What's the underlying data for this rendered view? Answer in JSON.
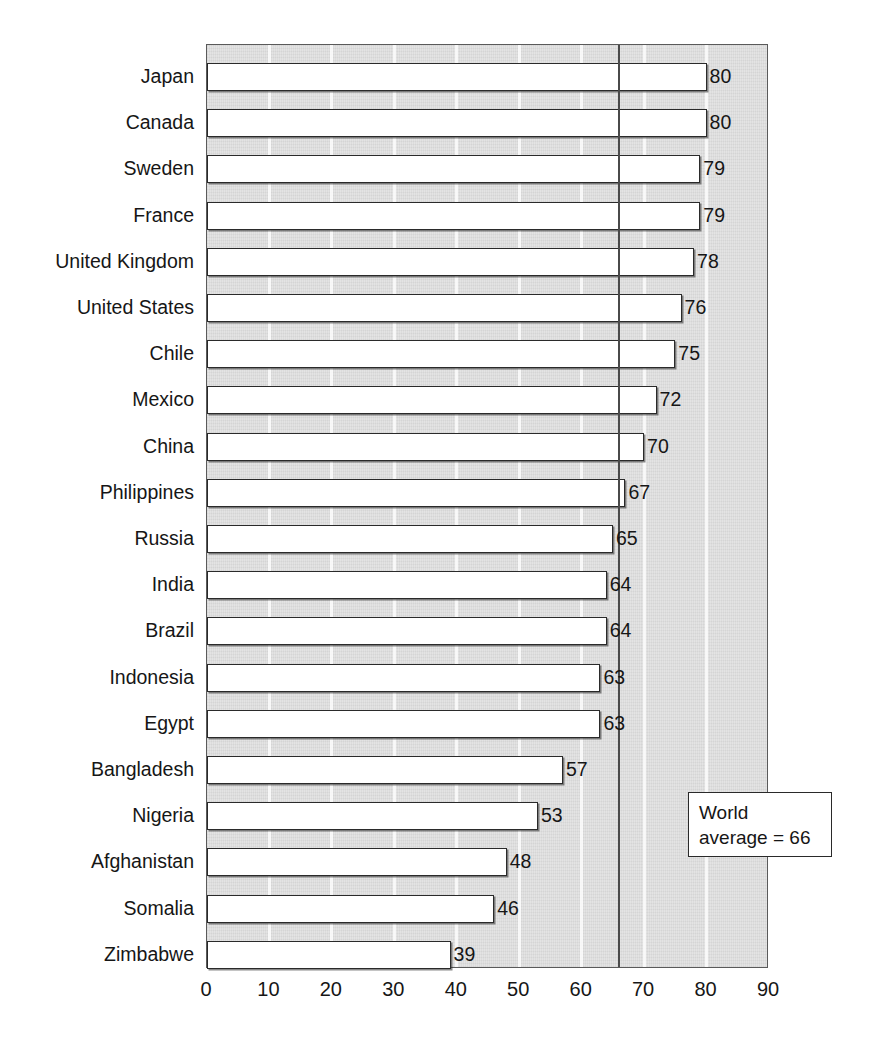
{
  "chart_data": {
    "type": "bar",
    "orientation": "horizontal",
    "title": "",
    "subtitle": "",
    "xlabel": "",
    "ylabel": "",
    "xlim": [
      0,
      90
    ],
    "xticks": [
      0,
      10,
      20,
      30,
      40,
      50,
      60,
      70,
      80,
      90
    ],
    "xtick_labels": [
      "0",
      "10",
      "20",
      "30",
      "40",
      "50",
      "60",
      "70",
      "80",
      "90"
    ],
    "grid": true,
    "grid_axis": "x",
    "legend": false,
    "categories": [
      "Japan",
      "Canada",
      "Sweden",
      "France",
      "United Kingdom",
      "United States",
      "Chile",
      "Mexico",
      "China",
      "Philippines",
      "Russia",
      "India",
      "Brazil",
      "Indonesia",
      "Egypt",
      "Bangladesh",
      "Nigeria",
      "Afghanistan",
      "Somalia",
      "Zimbabwe"
    ],
    "values": [
      80,
      80,
      79,
      79,
      78,
      76,
      75,
      72,
      70,
      67,
      65,
      64,
      64,
      63,
      63,
      57,
      53,
      48,
      46,
      39
    ],
    "data_labels": [
      "80",
      "80",
      "79",
      "79",
      "78",
      "76",
      "75",
      "72",
      "70",
      "67",
      "65",
      "64",
      "64",
      "63",
      "63",
      "57",
      "53",
      "48",
      "46",
      "39"
    ],
    "annotations": [
      {
        "name": "world-average",
        "value": 66,
        "line1": "World",
        "line2": "average = 66"
      }
    ],
    "colors": {
      "plot_background": "#dcdcdc",
      "bar_fill": "#ffffff",
      "bar_border": "#2a2a2a",
      "gridline": "#ffffff",
      "average_line": "#4a4a4a",
      "text": "#161616",
      "page_background": "#ffffff"
    }
  }
}
